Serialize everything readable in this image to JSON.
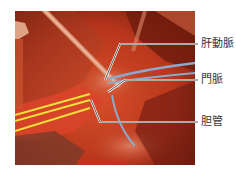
{
  "figure": {
    "background": "#ffffff",
    "tape_colors": {
      "yellow": "#f2e03a",
      "blue": "#8fa7c8"
    },
    "labels": [
      {
        "id": "hepatic-artery",
        "text": "肝動脈",
        "y": 44
      },
      {
        "id": "portal-vein",
        "text": "門脈",
        "y": 80
      },
      {
        "id": "bile-duct",
        "text": "胆管",
        "y": 122
      }
    ]
  }
}
